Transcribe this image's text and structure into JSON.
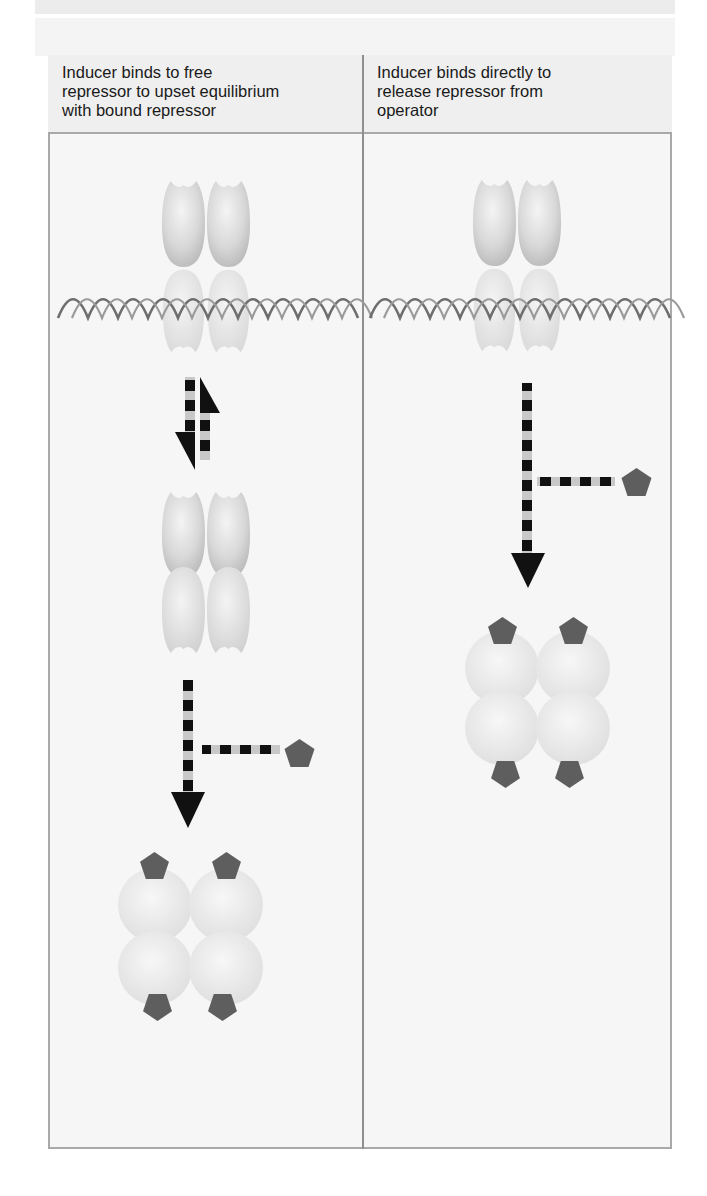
{
  "figure": {
    "panels": [
      {
        "id": "left",
        "caption": "Inducer binds to free\nrepressor to upset equilibrium\nwith bound repressor",
        "elements": [
          "repressor-bound-to-operator-dna",
          "equilibrium-arrows",
          "free-repressor",
          "inducer-binding-arrow",
          "inducer",
          "inducer-repressor-complex"
        ]
      },
      {
        "id": "right",
        "caption": "Inducer binds directly to\nrelease repressor from\noperator",
        "elements": [
          "repressor-bound-to-operator-dna",
          "inducer-binding-arrow",
          "inducer",
          "inducer-repressor-complex"
        ]
      }
    ],
    "colors": {
      "frame": "#a9a9a9",
      "panel_bg": "#f6f6f6",
      "header_bg": "#efefef",
      "repressor": "#d4d4d4",
      "inducer": "#5e5e5e",
      "arrow": "#111111",
      "arrow_gap": "#c8c8c8",
      "dna": "#7a7a7a"
    }
  }
}
